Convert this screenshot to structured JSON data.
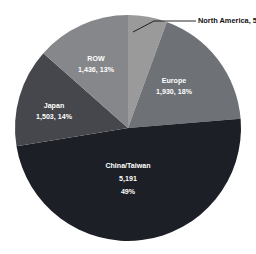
{
  "chart_data": {
    "type": "pie",
    "title": "",
    "subtitle": "",
    "xlabel": "",
    "ylabel": "",
    "legend_position": "none",
    "grid": false,
    "total": 10655,
    "categories": [
      "North America",
      "Europe",
      "China/Taiwan",
      "Japan",
      "ROW"
    ],
    "values": [
      595,
      1930,
      5191,
      1503,
      1436
    ],
    "percents": [
      6,
      18,
      49,
      14,
      13
    ],
    "slices": [
      {
        "name": "North America",
        "value": 595,
        "value_text": "595",
        "percent": 6,
        "percent_text": "6%",
        "label_text": "North America, 595, 6%",
        "color": "#9a9a9a",
        "label_placement": "callout",
        "text_color": "dark"
      },
      {
        "name": "Europe",
        "value": 1930,
        "value_text": "1,930",
        "percent": 18,
        "percent_text": "18%",
        "label_line1": "Europe",
        "label_line2": "1,930, 18%",
        "color": "#6e7176",
        "label_placement": "inside",
        "text_color": "light"
      },
      {
        "name": "China/Taiwan",
        "value": 5191,
        "value_text": "5,191",
        "percent": 49,
        "percent_text": "49%",
        "label_line1": "China/Taiwan",
        "label_line2": "5,191",
        "label_line3": "49%",
        "color": "#1c1f26",
        "label_placement": "inside",
        "text_color": "light"
      },
      {
        "name": "Japan",
        "value": 1503,
        "value_text": "1,503",
        "percent": 14,
        "percent_text": "14%",
        "label_line1": "Japan",
        "label_line2": "1,503, 14%",
        "color": "#46474c",
        "label_placement": "inside",
        "text_color": "light"
      },
      {
        "name": "ROW",
        "value": 1436,
        "value_text": "1,436",
        "percent": 13,
        "percent_text": "13%",
        "label_line1": "ROW",
        "label_line2": "1,436, 13%",
        "color": "#86878a",
        "label_placement": "inside",
        "text_color": "light"
      }
    ]
  },
  "colors": {
    "background": "#ffffff",
    "north_america": "#9a9a9a",
    "europe": "#6e7176",
    "china_taiwan": "#1c1f26",
    "japan": "#46474c",
    "row": "#86878a",
    "callout_text": "#111111",
    "inside_text": "#ffffff"
  }
}
